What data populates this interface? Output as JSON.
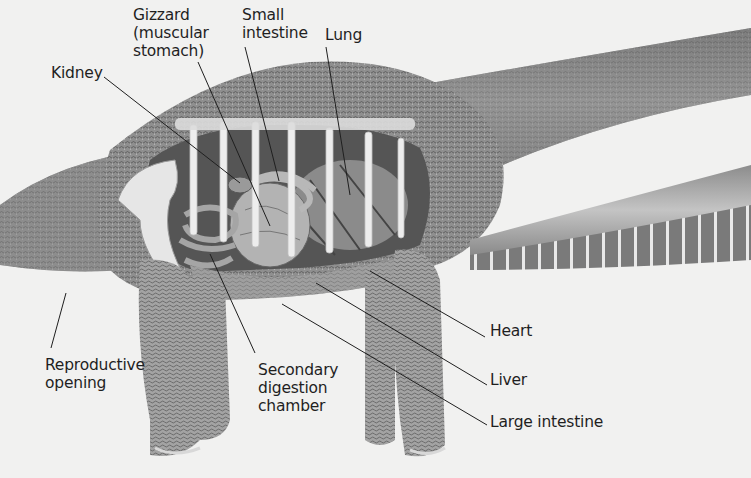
{
  "diagram": {
    "colors": {
      "background": "#f1f1f0",
      "skin": "#8f8f8f",
      "skin_dark": "#6e6e6e",
      "skin_light": "#b9b9b9",
      "cavity": "#5a5a5a",
      "organ": "#a7a7a7",
      "rib": "#ececec",
      "leader_line": "#1f1f1f",
      "label_text": "#1f1f1f"
    },
    "labels": [
      {
        "id": "kidney",
        "text": "Kidney",
        "x": 51,
        "y": 64
      },
      {
        "id": "gizzard",
        "text": "Gizzard\n(muscular\nstomach)",
        "x": 133,
        "y": 6
      },
      {
        "id": "small-intestine",
        "text": "Small\nintestine",
        "x": 242,
        "y": 6
      },
      {
        "id": "lung",
        "text": "Lung",
        "x": 325,
        "y": 26
      },
      {
        "id": "heart",
        "text": "Heart",
        "x": 490,
        "y": 322
      },
      {
        "id": "liver",
        "text": "Liver",
        "x": 490,
        "y": 371
      },
      {
        "id": "large-intestine",
        "text": "Large intestine",
        "x": 490,
        "y": 413
      },
      {
        "id": "reproductive-opening",
        "text": "Reproductive\nopening",
        "x": 45,
        "y": 356
      },
      {
        "id": "secondary-digestion-chamber",
        "text": "Secondary\ndigestion\nchamber",
        "x": 258,
        "y": 361
      }
    ],
    "leader_lines": [
      {
        "id": "kidney",
        "x1": 104,
        "y1": 77,
        "x2": 240,
        "y2": 183
      },
      {
        "id": "gizzard",
        "x1": 198,
        "y1": 62,
        "x2": 270,
        "y2": 226
      },
      {
        "id": "small-intestine",
        "x1": 245,
        "y1": 47,
        "x2": 279,
        "y2": 181
      },
      {
        "id": "lung",
        "x1": 326,
        "y1": 47,
        "x2": 350,
        "y2": 195
      },
      {
        "id": "heart",
        "x1": 485,
        "y1": 337,
        "x2": 370,
        "y2": 271
      },
      {
        "id": "liver",
        "x1": 487,
        "y1": 385,
        "x2": 316,
        "y2": 283
      },
      {
        "id": "large-intestine",
        "x1": 487,
        "y1": 425,
        "x2": 282,
        "y2": 304
      },
      {
        "id": "reproductive-opening",
        "x1": 51,
        "y1": 348,
        "x2": 66,
        "y2": 293
      },
      {
        "id": "secondary-digestion-chamber",
        "x1": 255,
        "y1": 353,
        "x2": 210,
        "y2": 254
      }
    ]
  }
}
